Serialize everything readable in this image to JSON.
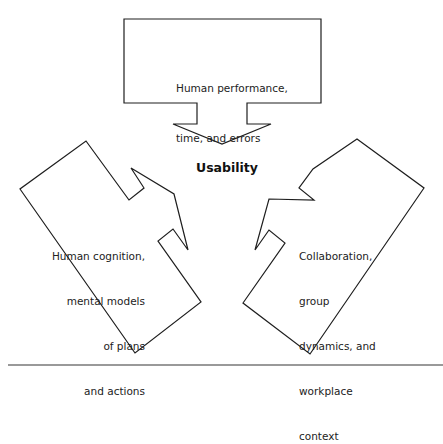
{
  "diagram": {
    "title": "Usability",
    "center_label": "Usability",
    "nodes": [
      {
        "id": "top",
        "lines": [
          "Human performance,",
          "time, and errors"
        ],
        "points": "124,19 321,19 321,103 247,103 247,124 271,124 222,144 173,124 197,124 197,103 124,103"
      },
      {
        "id": "left",
        "lines": [
          "Human cognition,",
          "mental models",
          "of plans",
          "and actions"
        ],
        "points": "86,141 129,200 144,188 131,168 174,194 188,250 173,229 158,241 201,302 135,353 20,189"
      },
      {
        "id": "right",
        "lines": [
          "Collaboration,",
          "group",
          "dynamics, and",
          "workplace",
          "context"
        ],
        "points": "357,139 424,188 310,354 243,303 285,243 269,230 255,250 269,199 314,200 299,188 313,169"
      }
    ],
    "divider": {
      "x1": 8,
      "x2": 443,
      "y": 365
    },
    "colors": {
      "stroke": "#1e1e1e",
      "fill": "#ffffff",
      "divider": "#777777",
      "text": "#222222"
    }
  }
}
